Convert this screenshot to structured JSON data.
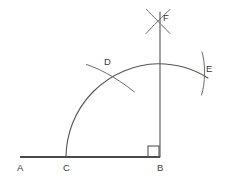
{
  "figure": {
    "canvas": {
      "width": 233,
      "height": 184,
      "background": "#ffffff"
    },
    "colors": {
      "line": "#4a4a4a",
      "arc": "#555555",
      "label": "#3a3a3a",
      "background": "#ffffff"
    },
    "points": [
      {
        "id": "A",
        "label": "A",
        "x": 20,
        "y": 157,
        "label_x": 17,
        "label_y": 163
      },
      {
        "id": "C",
        "label": "C",
        "x": 67,
        "y": 157,
        "label_x": 63,
        "label_y": 163
      },
      {
        "id": "B",
        "label": "B",
        "x": 160,
        "y": 157,
        "label_x": 157,
        "label_y": 163
      },
      {
        "id": "D",
        "label": "D",
        "x": 107,
        "y": 73,
        "label_x": 104,
        "label_y": 57
      },
      {
        "id": "E",
        "label": "E",
        "x": 203,
        "y": 73,
        "label_x": 206,
        "label_y": 64
      },
      {
        "id": "F",
        "label": "F",
        "x": 158,
        "y": 21,
        "label_x": 163,
        "label_y": 13
      }
    ],
    "segments": [
      {
        "name": "baseline-AB",
        "from": "A",
        "to": "B",
        "x1": 20,
        "y1": 157,
        "x2": 160,
        "y2": 157
      },
      {
        "name": "perpendicular-BF",
        "from": "B",
        "to": "F",
        "x1": 160,
        "y1": 157,
        "x2": 160,
        "y2": 12
      }
    ],
    "right_angle": {
      "name": "right-angle-at-B",
      "vertex": "B",
      "x": 148,
      "y": 146,
      "size": 11,
      "measure": "90"
    },
    "arcs": [
      {
        "name": "main-arc-from-C",
        "center": "B",
        "cx": 160,
        "cy": 157,
        "radius": 94,
        "path": "M 66 157 A 94 94 0 0 1 158 63.8 A 94 94 0 0 1 208 78"
      },
      {
        "name": "arc-cross-D-upper",
        "path": "M 86.5 64.5 C 96 67.5 114 75.5 134.5 92"
      },
      {
        "name": "arc-cross-E-vertical",
        "path": "M 202 52 C 205.5 62 205.5 84 201.5 95"
      },
      {
        "name": "arc-cross-F-left",
        "path": "M 146.5 9.5 C 152 15 163.5 27 170 33.5"
      },
      {
        "name": "arc-cross-F-right",
        "path": "M 170 9.5 C 164 15 152 27 146 33.5"
      }
    ]
  }
}
